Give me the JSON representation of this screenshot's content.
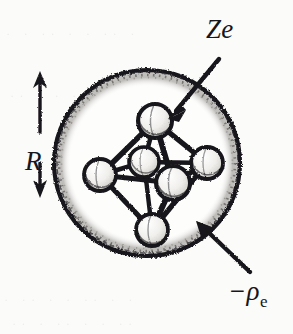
{
  "figure": {
    "background_color": "#fbfbfa",
    "ink_color": "#17161a"
  },
  "labels": {
    "nuclear_charge": "Ze",
    "electron_density_sign": "−ρ",
    "electron_density_subscript": "e",
    "radius": "R"
  },
  "annotations": [
    {
      "name": "ze-callout",
      "text": "Ze",
      "arrow_from": [
        216,
        62
      ],
      "arrow_to": [
        168,
        118
      ],
      "points_at": "top-sphere-of-cluster"
    },
    {
      "name": "rho-callout",
      "text": "−ρe",
      "arrow_from": [
        248,
        275
      ],
      "arrow_to": [
        196,
        222
      ],
      "points_at": "charged-sphere-interior"
    },
    {
      "name": "radius-dimension",
      "text": "R",
      "arrow_up_to": [
        40,
        74
      ],
      "arrow_down_to": [
        40,
        196
      ],
      "orientation": "vertical-double-arrow"
    }
  ],
  "big_sphere": {
    "name": "uniform-charge-sphere",
    "center": [
      147,
      163
    ],
    "radius": 93,
    "outline_color": "#17161a",
    "fill_color": "#fdfdfc",
    "rim_texture": "stippled"
  },
  "cluster": {
    "name": "octahedral-charge-cluster",
    "geometry": "octahedron",
    "node_count": 6,
    "node_color": "#f2f1ef",
    "node_outline_color": "#17161a",
    "bond_color": "#17161a",
    "nodes": [
      {
        "id": "top",
        "center": [
          155,
          121
        ],
        "r": 17
      },
      {
        "id": "left",
        "center": [
          100,
          175
        ],
        "r": 16
      },
      {
        "id": "right",
        "center": [
          207,
          163
        ],
        "r": 16
      },
      {
        "id": "bottom",
        "center": [
          152,
          230
        ],
        "r": 16
      },
      {
        "id": "middle-back",
        "center": [
          144,
          162
        ],
        "r": 15
      },
      {
        "id": "middle-front",
        "center": [
          173,
          183
        ],
        "r": 17
      }
    ],
    "bonds": [
      [
        "top",
        "left"
      ],
      [
        "top",
        "right"
      ],
      [
        "top",
        "middle-back"
      ],
      [
        "top",
        "middle-front"
      ],
      [
        "bottom",
        "left"
      ],
      [
        "bottom",
        "right"
      ],
      [
        "bottom",
        "middle-back"
      ],
      [
        "bottom",
        "middle-front"
      ],
      [
        "left",
        "middle-back"
      ],
      [
        "left",
        "middle-front"
      ],
      [
        "right",
        "middle-back"
      ],
      [
        "right",
        "middle-front"
      ]
    ]
  },
  "ghost_text": [
    {
      "text": "· ·  ·· ·  · ··  ·",
      "left": 6,
      "top": 26
    },
    {
      "text": "·· ·  · ··  ·· ·",
      "left": 10,
      "top": 88
    },
    {
      "text": "· ··  · ·  ·· · ·",
      "left": 4,
      "top": 292
    },
    {
      "text": "·· · ··  · ·  ··",
      "left": 12,
      "top": 316
    }
  ]
}
